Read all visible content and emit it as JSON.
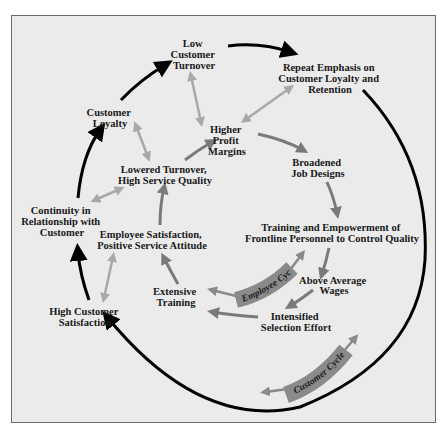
{
  "diagram": {
    "title": "",
    "colors": {
      "background": "#ebebeb",
      "frame_border": "#6a6a6a",
      "customer_cycle_arrow": "#000000",
      "employee_cycle_arrow": "#7a7a7a",
      "link_arrow": "#a8a8a8",
      "band_fill": "#8a8a8a",
      "text": "#1a1a1a"
    },
    "cycles": {
      "customer": {
        "label": "Customer Cycle"
      },
      "employee": {
        "label": "Employee Cycle"
      }
    },
    "nodes": {
      "low_customer_turnover": [
        "Low",
        "Customer",
        "Turnover"
      ],
      "repeat_emphasis": [
        "Repeat Emphasis on",
        "Customer Loyalty and",
        "Retention"
      ],
      "customer_loyalty": [
        "Customer",
        "Loyalty"
      ],
      "higher_profit_margins": [
        "Higher",
        "Profit",
        "Margins"
      ],
      "lowered_turnover": [
        "Lowered Turnover,",
        "High Service Quality"
      ],
      "broadened_job_designs": [
        "Broadened",
        "Job Designs"
      ],
      "continuity": [
        "Continuity in",
        "Relationship with",
        "Customer"
      ],
      "employee_satisfaction": [
        "Employee Satisfaction,",
        "Positive Service Attitude"
      ],
      "training_empowerment": [
        "Training and Empowerment of",
        "Frontline Personnel to Control Quality"
      ],
      "above_average_wages": [
        "Above Average",
        "Wages"
      ],
      "extensive_training": [
        "Extensive",
        "Training"
      ],
      "intensified_selection": [
        "Intensified",
        "Selection Effort"
      ],
      "high_customer_satisfaction": [
        "High Customer",
        "Satisfaction"
      ]
    },
    "customer_cycle_sequence": [
      "High Customer Satisfaction",
      "Continuity in Relationship with Customer",
      "Customer Loyalty",
      "Low Customer Turnover",
      "Repeat Emphasis on Customer Loyalty and Retention",
      "High Customer Satisfaction"
    ],
    "employee_cycle_sequence": [
      "Higher Profit Margins",
      "Broadened Job Designs",
      "Training and Empowerment of Frontline Personnel to Control Quality",
      "Above Average Wages",
      "Intensified Selection Effort",
      "Extensive Training",
      "Employee Satisfaction, Positive Service Attitude",
      "Lowered Turnover, High Service Quality",
      "Higher Profit Margins"
    ]
  }
}
